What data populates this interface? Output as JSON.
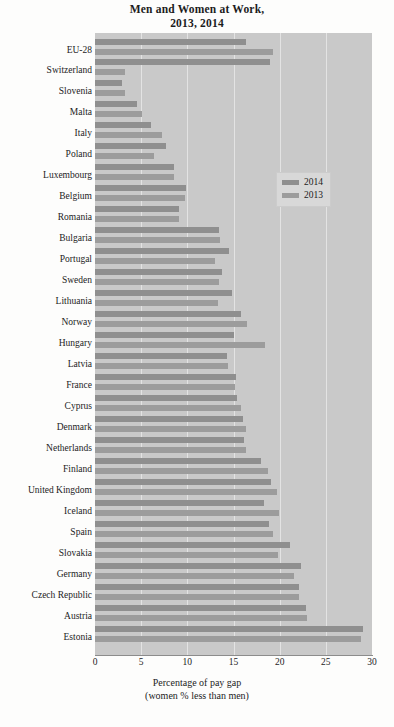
{
  "title": {
    "line1": "Men and Women at Work,",
    "line2": "2013, 2014"
  },
  "legend": {
    "items": [
      {
        "label": "2014",
        "color": "#8f8f8f"
      },
      {
        "label": "2013",
        "color": "#9c9c9c"
      }
    ]
  },
  "axis": {
    "x_title_line1": "Percentage of pay gap",
    "x_title_line2": "(women % less than men)",
    "ticks": [
      "0",
      "5",
      "10",
      "15",
      "20",
      "25",
      "30"
    ]
  },
  "chart_data": {
    "type": "bar",
    "orientation": "horizontal",
    "title": "Men and Women at Work, 2013, 2014",
    "xlabel": "Percentage of pay gap (women % less than men)",
    "ylabel": "",
    "xlim": [
      0,
      30
    ],
    "xticks": [
      0,
      5,
      10,
      15,
      20,
      25,
      30
    ],
    "grid": true,
    "legend_position": "middle-right",
    "categories": [
      "EU-28",
      "Switzerland",
      "Slovenia",
      "Malta",
      "Italy",
      "Poland",
      "Luxembourg",
      "Belgium",
      "Romania",
      "Bulgaria",
      "Portugal",
      "Sweden",
      "Lithuania",
      "Norway",
      "Hungary",
      "Latvia",
      "France",
      "Cyprus",
      "Denmark",
      "Netherlands",
      "Finland",
      "United Kingdom",
      "Iceland",
      "Spain",
      "Slovakia",
      "Germany",
      "Czech Republic",
      "Austria",
      "Estonia"
    ],
    "series": [
      {
        "name": "2014",
        "color": "#8f8f8f",
        "values": [
          16.4,
          18.9,
          2.9,
          4.5,
          6.1,
          7.7,
          8.6,
          9.9,
          9.1,
          13.4,
          14.5,
          13.8,
          14.8,
          15.8,
          15.1,
          14.3,
          15.3,
          15.4,
          16.0,
          16.1,
          18.0,
          19.1,
          18.3,
          18.8,
          21.1,
          22.3,
          22.1,
          22.9,
          29.0
        ]
      },
      {
        "name": "2013",
        "color": "#9c9c9c",
        "values": [
          19.3,
          3.2,
          3.2,
          5.1,
          7.3,
          6.4,
          8.6,
          9.8,
          9.1,
          13.5,
          13.0,
          13.4,
          13.3,
          16.5,
          18.4,
          14.4,
          15.2,
          15.8,
          16.4,
          16.4,
          18.7,
          19.7,
          19.9,
          19.3,
          19.8,
          21.6,
          22.1,
          23.0,
          28.8
        ]
      }
    ]
  },
  "layout": {
    "rows": [
      {
        "name": "EU-28",
        "top": 6,
        "v2014": 16.4,
        "v2013": 19.3
      },
      {
        "name": "Switzerland",
        "top": 26,
        "v2014": 18.9,
        "v2013": 3.2
      },
      {
        "name": "Slovenia",
        "top": 47,
        "v2014": 2.9,
        "v2013": 3.2
      },
      {
        "name": "Malta",
        "top": 68,
        "v2014": 4.5,
        "v2013": 5.1
      },
      {
        "name": "Italy",
        "top": 89,
        "v2014": 6.1,
        "v2013": 7.3
      },
      {
        "name": "Poland",
        "top": 110,
        "v2014": 7.7,
        "v2013": 6.4
      },
      {
        "name": "Luxembourg",
        "top": 131,
        "v2014": 8.6,
        "v2013": 8.6
      },
      {
        "name": "Belgium",
        "top": 152,
        "v2014": 9.9,
        "v2013": 9.8
      },
      {
        "name": "Romania",
        "top": 173,
        "v2014": 9.1,
        "v2013": 9.1
      },
      {
        "name": "Bulgaria",
        "top": 194,
        "v2014": 13.4,
        "v2013": 13.5
      },
      {
        "name": "Portugal",
        "top": 215,
        "v2014": 14.5,
        "v2013": 13.0
      },
      {
        "name": "Sweden",
        "top": 236,
        "v2014": 13.8,
        "v2013": 13.4
      },
      {
        "name": "Lithuania",
        "top": 257,
        "v2014": 14.8,
        "v2013": 13.3
      },
      {
        "name": "Norway",
        "top": 278,
        "v2014": 15.8,
        "v2013": 16.5
      },
      {
        "name": "Hungary",
        "top": 299,
        "v2014": 15.1,
        "v2013": 18.4
      },
      {
        "name": "Latvia",
        "top": 320,
        "v2014": 14.3,
        "v2013": 14.4
      },
      {
        "name": "France",
        "top": 341,
        "v2014": 15.3,
        "v2013": 15.2
      },
      {
        "name": "Cyprus",
        "top": 362,
        "v2014": 15.4,
        "v2013": 15.8
      },
      {
        "name": "Denmark",
        "top": 383,
        "v2014": 16.0,
        "v2013": 16.4
      },
      {
        "name": "Netherlands",
        "top": 404,
        "v2014": 16.1,
        "v2013": 16.4
      },
      {
        "name": "Finland",
        "top": 425,
        "v2014": 18.0,
        "v2013": 18.7
      },
      {
        "name": "United Kingdom",
        "top": 446,
        "v2014": 19.1,
        "v2013": 19.7
      },
      {
        "name": "Iceland",
        "top": 467,
        "v2014": 18.3,
        "v2013": 19.9
      },
      {
        "name": "Spain",
        "top": 488,
        "v2014": 18.8,
        "v2013": 19.3
      },
      {
        "name": "Slovakia",
        "top": 509,
        "v2014": 21.1,
        "v2013": 19.8
      },
      {
        "name": "Germany",
        "top": 530,
        "v2014": 22.3,
        "v2013": 21.6
      },
      {
        "name": "Czech Republic",
        "top": 551,
        "v2014": 22.1,
        "v2013": 22.1
      },
      {
        "name": "Austria",
        "top": 572,
        "v2014": 22.9,
        "v2013": 23.0
      },
      {
        "name": "Estonia",
        "top": 593,
        "v2014": 29.0,
        "v2013": 28.8
      }
    ]
  }
}
